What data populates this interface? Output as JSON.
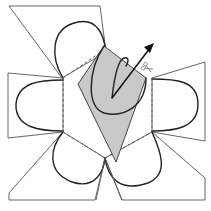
{
  "figure": {
    "title": "",
    "colors": {
      "background": "#ffffff",
      "outline": "#555555",
      "petal_curve": "#222222",
      "shaded_face": "#c9c9c9",
      "arrow": "#111111",
      "scissors": "#666666"
    },
    "icons": {
      "scissors": "scissors-icon",
      "arrow": "arrow-up-right-icon"
    },
    "labels": []
  }
}
